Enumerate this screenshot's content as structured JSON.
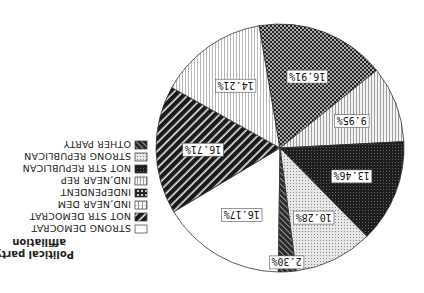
{
  "orientation": "rotated-180",
  "chart_data": {
    "type": "pie",
    "title": "Political party affiliation",
    "title_lines": [
      "Political party",
      "affiliation"
    ],
    "legend_position": "left",
    "categories": [
      "STRONG DEMOCRAT",
      "NOT STR DEMOCRAT",
      "IND,NEAR DEM",
      "INDEPENDENT",
      "IND,NEAR REP",
      "NOT STR REPUBLICAN",
      "STRONG REPUBLICAN",
      "OTHER PARTY"
    ],
    "values": [
      16.17,
      16.71,
      14.21,
      16.91,
      9.95,
      13.46,
      10.28,
      2.3
    ],
    "labels": [
      "16.17%",
      "16.71%",
      "14.21%",
      "16.91%",
      "9.95%",
      "13.46%",
      "10.28%",
      "2.30%"
    ],
    "patterns": [
      "white",
      "black-diagonal-stripes",
      "light-vertical-lines",
      "checker",
      "vertical-lines",
      "dark-crosshatch",
      "light-dots",
      "dark-diagonal"
    ],
    "units": "%"
  },
  "legend": {
    "title_line1": "Political party",
    "title_line2": "affiliation",
    "items": [
      {
        "label": "STRONG DEMOCRAT",
        "pattern": "p-white"
      },
      {
        "label": "NOT STR DEMOCRAT",
        "pattern": "p-stripes"
      },
      {
        "label": "IND,NEAR DEM",
        "pattern": "p-vgrid"
      },
      {
        "label": "INDEPENDENT",
        "pattern": "p-circles"
      },
      {
        "label": "IND,NEAR REP",
        "pattern": "p-vlines"
      },
      {
        "label": "NOT STR REPUBLICAN",
        "pattern": "p-darkx"
      },
      {
        "label": "STRONG REPUBLICAN",
        "pattern": "p-dots"
      },
      {
        "label": "OTHER PARTY",
        "pattern": "p-darkdiag"
      }
    ]
  },
  "slices": [
    {
      "label": "16.17%",
      "value": 16.17,
      "pattern": "p-white"
    },
    {
      "label": "16.71%",
      "value": 16.71,
      "pattern": "p-stripes"
    },
    {
      "label": "14.21%",
      "value": 14.21,
      "pattern": "p-vlines-light"
    },
    {
      "label": "16.91%",
      "value": 16.91,
      "pattern": "p-checker"
    },
    {
      "label": "9.95%",
      "value": 9.95,
      "pattern": "p-vlines"
    },
    {
      "label": "13.46%",
      "value": 13.46,
      "pattern": "p-darkx"
    },
    {
      "label": "10.28%",
      "value": 10.28,
      "pattern": "p-dots"
    },
    {
      "label": "2.30%",
      "value": 2.3,
      "pattern": "p-darkdiag"
    }
  ]
}
